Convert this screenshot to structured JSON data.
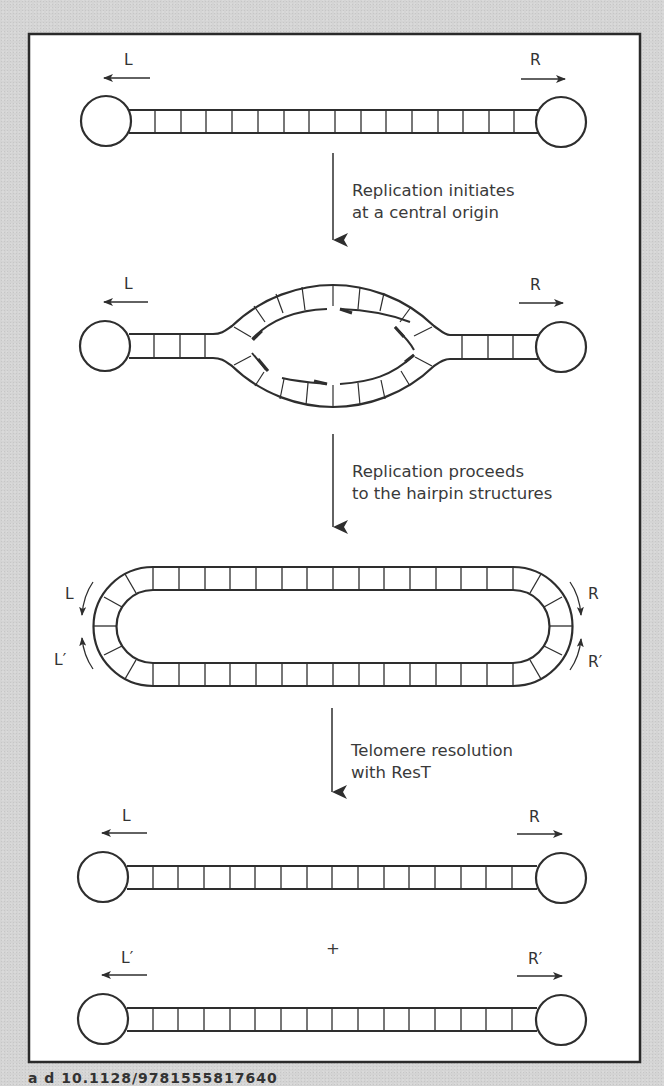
{
  "figure": {
    "colors": {
      "background": "#d4d4d4",
      "panel": "#ffffff",
      "stroke": "#2e2e2e",
      "text": "#333333"
    },
    "stages": [
      {
        "name": "initial-linear-molecule",
        "left_label": "L",
        "right_label": "R",
        "rungs": 16
      },
      {
        "name": "replication-bubble",
        "left_label": "L",
        "right_label": "R"
      },
      {
        "name": "circular-dimer-intermediate",
        "left_labels": [
          "L",
          "L′"
        ],
        "right_labels": [
          "R",
          "R′"
        ]
      },
      {
        "name": "resolved-products",
        "products": [
          {
            "left_label": "L",
            "right_label": "R"
          },
          {
            "left_label": "L′",
            "right_label": "R′"
          }
        ],
        "joiner": "+"
      }
    ],
    "steps": [
      {
        "line1": "Replication initiates",
        "line2": "at a central origin"
      },
      {
        "line1": "Replication proceeds",
        "line2": "to the hairpin structures"
      },
      {
        "line1": "Telomere resolution",
        "line2": "with ResT"
      }
    ],
    "footer_partial": "a   d   10.1128/9781555817640"
  }
}
